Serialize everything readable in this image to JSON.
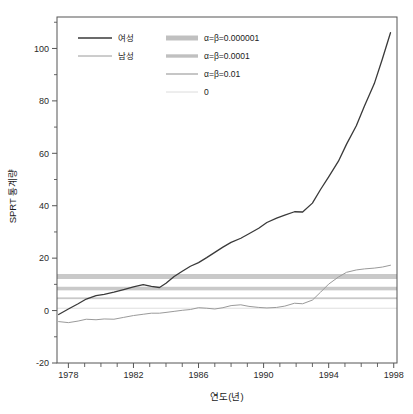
{
  "chart_data": {
    "type": "line",
    "title": "",
    "xlabel": "연도(년)",
    "ylabel": "SPRT 통계량",
    "xlim": [
      1977.3,
      1998.2
    ],
    "ylim": [
      -20,
      112
    ],
    "grid": false,
    "legend_position": "top-left",
    "xticks_major": [
      1978,
      1982,
      1986,
      1990,
      1994,
      1998
    ],
    "xticks_minor": [
      1979,
      1980,
      1981,
      1983,
      1984,
      1985,
      1987,
      1988,
      1989,
      1991,
      1992,
      1993,
      1995,
      1996,
      1997
    ],
    "yticks": [
      -20,
      0,
      20,
      40,
      60,
      80,
      100
    ],
    "series": [
      {
        "name": "여성",
        "color": "#3a3a3a",
        "width": 1.3,
        "x": [
          1977.4,
          1978.0,
          1978.6,
          1979.1,
          1979.7,
          1980.2,
          1980.8,
          1981.4,
          1982.0,
          1982.6,
          1983.1,
          1983.6,
          1984.0,
          1984.5,
          1985.0,
          1985.5,
          1986.0,
          1986.5,
          1987.0,
          1987.5,
          1988.0,
          1988.6,
          1989.1,
          1989.7,
          1990.2,
          1990.8,
          1991.3,
          1991.9,
          1992.4,
          1993.0,
          1993.5,
          1994.0,
          1994.6,
          1995.1,
          1995.7,
          1996.2,
          1996.8,
          1997.3,
          1997.8
        ],
        "y": [
          -1.5,
          0.6,
          2.6,
          4.4,
          5.7,
          6.2,
          7.0,
          8.0,
          9.0,
          9.9,
          9.2,
          8.8,
          10.4,
          13.0,
          15.0,
          16.9,
          18.3,
          20.2,
          22.2,
          24.2,
          26.0,
          27.6,
          29.3,
          31.4,
          33.6,
          35.3,
          36.4,
          37.7,
          37.6,
          41.0,
          46.2,
          51.0,
          57.0,
          63.5,
          70.5,
          78.0,
          86.5,
          96.0,
          106.0
        ]
      },
      {
        "name": "남성",
        "color": "#9a9a9a",
        "width": 1.0,
        "x": [
          1977.4,
          1978.0,
          1978.6,
          1979.1,
          1979.7,
          1980.2,
          1980.8,
          1981.4,
          1982.0,
          1982.6,
          1983.1,
          1983.6,
          1984.0,
          1984.5,
          1985.0,
          1985.5,
          1986.0,
          1986.5,
          1987.0,
          1987.5,
          1988.0,
          1988.6,
          1989.1,
          1989.7,
          1990.2,
          1990.8,
          1991.3,
          1991.9,
          1992.4,
          1993.0,
          1993.5,
          1994.0,
          1994.6,
          1995.1,
          1995.7,
          1996.2,
          1996.8,
          1997.3,
          1997.8
        ],
        "y": [
          -4.2,
          -4.6,
          -4.0,
          -3.3,
          -3.5,
          -3.2,
          -3.3,
          -2.6,
          -1.9,
          -1.4,
          -1.0,
          -1.0,
          -0.7,
          -0.3,
          0.1,
          0.4,
          1.1,
          0.9,
          0.6,
          1.1,
          1.9,
          2.2,
          1.6,
          1.2,
          1.0,
          1.2,
          1.7,
          2.8,
          2.6,
          4.0,
          7.0,
          10.1,
          12.8,
          14.6,
          15.5,
          15.9,
          16.2,
          16.6,
          17.3
        ]
      }
    ],
    "threshold_bands": [
      {
        "label": "α=β=0.000001",
        "value": 13.0,
        "thickness": 5.0,
        "color": "#c9c9c9"
      },
      {
        "label": "α=β=0.0001",
        "value": 8.4,
        "thickness": 3.6,
        "color": "#c9c9c9"
      },
      {
        "label": "α=β=0.01",
        "value": 4.7,
        "thickness": 1.8,
        "color": "#c9c9c9"
      },
      {
        "label": "0",
        "value": 0.9,
        "thickness": 1.0,
        "color": "#dedede"
      }
    ]
  },
  "legend": {
    "series_entries": [
      {
        "label": "여성",
        "color": "#3a3a3a",
        "thickness": 1.4
      },
      {
        "label": "남성",
        "color": "#9a9a9a",
        "thickness": 1.0
      }
    ],
    "band_entries": [
      {
        "label": "α=β=0.000001",
        "color": "#c0c0c0",
        "thickness": 5.0
      },
      {
        "label": "α=β=0.0001",
        "color": "#c0c0c0",
        "thickness": 3.4
      },
      {
        "label": "α=β=0.01",
        "color": "#c0c0c0",
        "thickness": 1.8
      },
      {
        "label": "0",
        "color": "#dcdcdc",
        "thickness": 1.0
      }
    ]
  },
  "axis": {
    "x_title": "연도(년)",
    "y_title": "SPRT 통계량",
    "x_tick_labels": [
      "1978",
      "1982",
      "1986",
      "1990",
      "1994",
      "1998"
    ],
    "y_tick_labels": [
      "-20",
      "0",
      "20",
      "40",
      "60",
      "80",
      "100"
    ]
  },
  "colors": {
    "frame": "#555555",
    "female_line": "#3a3a3a",
    "male_line": "#9a9a9a",
    "band": "#c9c9c9",
    "band_light": "#dedede",
    "background": "#ffffff"
  }
}
